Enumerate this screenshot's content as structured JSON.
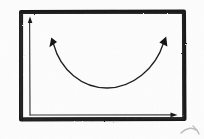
{
  "figure": {
    "title": "Hand-drawn sketch of a U-shaped (convex) curve inside a boxed coordinate frame",
    "medium": "pen on paper, scanned",
    "background_color": "#fdfdfd",
    "ink_color": "#111111",
    "canvas": {
      "width": 204,
      "height": 139
    }
  },
  "frame": {
    "name": "hand-drawn rectangular border",
    "color": "#141414",
    "stroke_width": 4,
    "x": 20,
    "y": 11,
    "width": 165,
    "height": 109
  },
  "axes": {
    "color": "#3a3a3a",
    "stroke_width": 1.2,
    "origin": {
      "x": 30,
      "y": 115
    },
    "y_axis": {
      "name": "vertical axis",
      "from": {
        "x": 30,
        "y": 115
      },
      "to": {
        "x": 30,
        "y": 18
      },
      "arrow": "up",
      "label": ""
    },
    "x_axis": {
      "name": "horizontal axis",
      "from": {
        "x": 30,
        "y": 115
      },
      "to": {
        "x": 176,
        "y": 115
      },
      "arrow": "right",
      "label": ""
    },
    "tick_labels": []
  },
  "curve": {
    "name": "double-headed U-shaped arrow",
    "shape": "convex parabola (smile)",
    "color": "#1a1a1a",
    "stroke_width": 1.3,
    "left_end": {
      "x": 52,
      "y": 41
    },
    "right_end": {
      "x": 165,
      "y": 40
    },
    "vertex": {
      "x": 107,
      "y": 88
    },
    "arrowheads": [
      "left-end-up-left",
      "right-end-up-right"
    ],
    "annotations": []
  },
  "artifacts": {
    "corner_squiggle": {
      "name": "faint ink mark below frame at bottom right",
      "x": 182,
      "y": 129,
      "color": "#8c8c8c",
      "note": "partially cropped"
    }
  },
  "text_content": {
    "visible_text": "",
    "note": "no legible text, labels, or numbers appear in this image"
  }
}
